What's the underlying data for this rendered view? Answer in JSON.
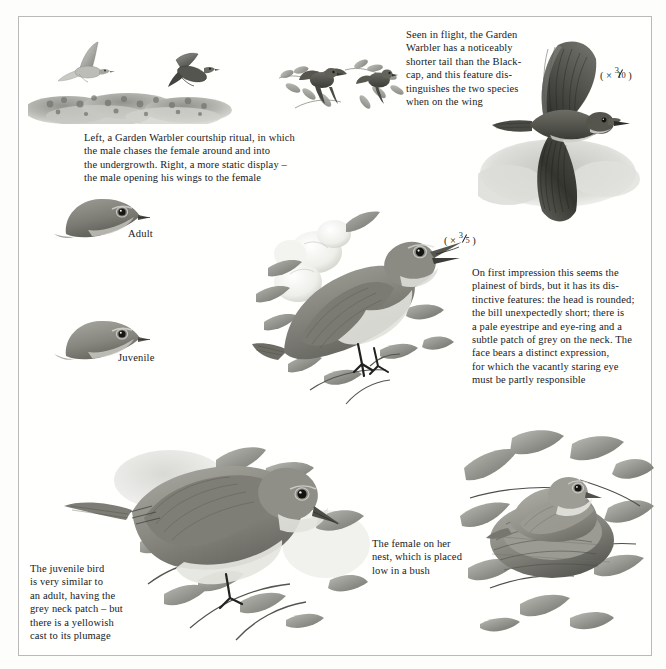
{
  "plate": {
    "subject": "Garden Warbler",
    "frame_color": "#b9b9b9",
    "background_color": "#fffffe",
    "ink_color": "#17191c"
  },
  "captions": {
    "courtship": "Left, a Garden Warbler courtship ritual, in which\nthe male chases the female around and into\nthe undergrowth. Right, a more static display –\nthe male opening his wings to the female",
    "in_flight": "Seen in flight, the Garden\nWarbler has a noticeably\nshorter tail than the Black-\ncap, and this feature dis-\ntinguishes the two species\nwhen on the wing",
    "plumage_notes": "On first impression this seems the\nplainest of birds, but it has its dis-\ntinctive features: the head is rounded;\nthe bill unexpectedly short; there is\na pale eyestripe and eye-ring and a\nsubtle patch of grey on the neck. The\nface bears a distinct expression,\nfor which the vacantly staring eye\nmust be partly responsible",
    "juvenile_notes": "The juvenile bird\nis very similar to\nan adult, having the\ngrey neck patch – but\nthere is a yellowish\ncast to its plumage",
    "nest_note": "The female on her\nnest, which is placed\nlow in a bush"
  },
  "labels": {
    "adult": "Adult",
    "juvenile": "Juvenile"
  },
  "scales": {
    "flight_bird": {
      "prefix": "( × ",
      "numerator": "3",
      "denominator": "10",
      "suffix": " )"
    },
    "perched_bird": {
      "prefix": "( × ",
      "numerator": "3",
      "denominator": "5",
      "suffix": " )"
    }
  },
  "illustrations": {
    "courtship_flight_left": "garden-warbler-flying-over-undergrowth",
    "courtship_flight_right": "garden-warbler-diving-into-undergrowth",
    "display_pair": "garden-warbler-pair-wing-display-in-foliage",
    "flight_profile": "garden-warbler-in-flight-underside",
    "head_adult": "garden-warbler-head-adult",
    "head_juvenile": "garden-warbler-head-juvenile",
    "perched_singing": "garden-warbler-perched-singing-on-blossom-branch",
    "juvenile_perched": "garden-warbler-juvenile-perched-on-branch",
    "female_on_nest": "garden-warbler-female-on-nest-in-bush"
  }
}
